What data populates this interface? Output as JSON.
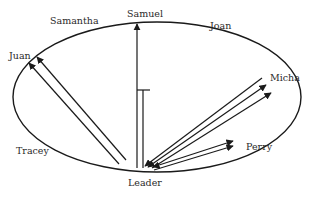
{
  "diagram": {
    "type": "sociogram",
    "center_node": "Leader",
    "nodes": [
      {
        "id": "samantha",
        "label": "Samantha"
      },
      {
        "id": "samuel",
        "label": "Samuel"
      },
      {
        "id": "joan",
        "label": "Joan"
      },
      {
        "id": "juan",
        "label": "Juan"
      },
      {
        "id": "micha",
        "label": "Micha"
      },
      {
        "id": "tracey",
        "label": "Tracey"
      },
      {
        "id": "perry",
        "label": "Perry"
      },
      {
        "id": "leader",
        "label": "Leader"
      }
    ],
    "edges": [
      {
        "from": "leader",
        "to": "samuel",
        "style": "arrow"
      },
      {
        "from": "leader",
        "to": "samuel",
        "style": "blocked-t-bar"
      },
      {
        "from": "leader",
        "to": "juan",
        "style": "arrow"
      },
      {
        "from": "leader",
        "to": "juan",
        "style": "arrow"
      },
      {
        "from": "micha",
        "to": "leader",
        "style": "arrow"
      },
      {
        "from": "leader",
        "to": "micha",
        "style": "arrow"
      },
      {
        "from": "leader",
        "to": "micha",
        "style": "arrow"
      },
      {
        "from": "leader",
        "to": "perry",
        "style": "double-arrow"
      },
      {
        "from": "perry",
        "to": "leader",
        "style": "arrow"
      }
    ],
    "colors": {
      "stroke": "#1a1a1a",
      "text": "#2a2a2a",
      "background": "#ffffff"
    }
  }
}
